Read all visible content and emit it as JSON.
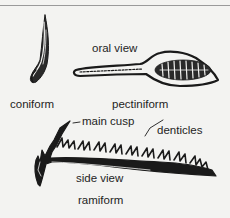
{
  "diagram": {
    "elements": [
      {
        "id": "coniform",
        "label": "coniform"
      },
      {
        "id": "pectiniform",
        "label": "pectiniform",
        "view_label": "oral view"
      },
      {
        "id": "ramiform",
        "label": "ramiform",
        "view_label": "side view",
        "annotations": {
          "main_cusp": "main cusp",
          "denticles": "denticles"
        }
      }
    ]
  },
  "colors": {
    "ink": "#1a1a1a",
    "background": "#f3f3f1",
    "rule": "#9a9a9a"
  }
}
